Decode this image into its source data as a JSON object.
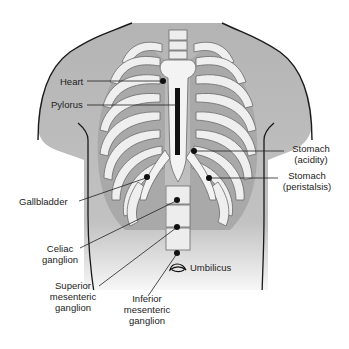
{
  "figure": {
    "type": "anatomical-diagram"
  },
  "colors": {
    "background": "#ffffff",
    "skin_shade": "#b9b9b9",
    "bone_fill": "#efefef",
    "bone_outline": "#6a6a6a",
    "intercostal": "#a9a9a9",
    "marker": "#111111",
    "leader_line": "#222222"
  },
  "labels": {
    "heart": "Heart",
    "pylorus": "Pylorus",
    "stomach_acidity_1": "Stomach",
    "stomach_acidity_2": "(acidity)",
    "stomach_peristalsis_1": "Stomach",
    "stomach_peristalsis_2": "(peristalsis)",
    "gallbladder": "Gallbladder",
    "celiac_1": "Celiac",
    "celiac_2": "ganglion",
    "superior_1": "Superior",
    "superior_2": "mesenteric",
    "superior_3": "ganglion",
    "inferior_1": "Inferior",
    "inferior_2": "mesenteric",
    "inferior_3": "ganglion",
    "umbilicus": "Umbilicus"
  },
  "markers": [
    {
      "name": "heart",
      "x": 163,
      "y": 81
    },
    {
      "name": "stomach-acidity",
      "x": 194,
      "y": 151
    },
    {
      "name": "gallbladder",
      "x": 147,
      "y": 177
    },
    {
      "name": "stomach-peristalsis",
      "x": 209,
      "y": 178
    },
    {
      "name": "celiac-ganglion",
      "x": 177,
      "y": 200
    },
    {
      "name": "superior-mesenteric-ganglion",
      "x": 177,
      "y": 227
    },
    {
      "name": "inferior-mesenteric-ganglion",
      "x": 177,
      "y": 253
    }
  ]
}
